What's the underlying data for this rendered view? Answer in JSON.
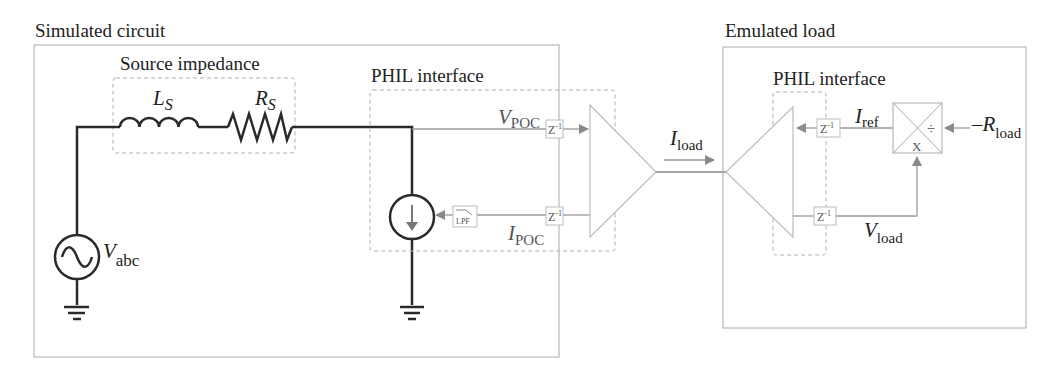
{
  "simulated_circuit": {
    "title": "Simulated circuit",
    "source_impedance": {
      "title": "Source impedance",
      "inductor": {
        "symbol": "L",
        "subscript": "S"
      },
      "resistor": {
        "symbol": "R",
        "subscript": "S"
      }
    },
    "voltage_source": {
      "symbol": "V",
      "subscript": "abc",
      "icon": "ac-source-icon"
    },
    "phil_interface": {
      "title": "PHIL interface",
      "v_signal": {
        "symbol": "V",
        "subscript": "POC"
      },
      "i_signal": {
        "symbol": "I",
        "subscript": "POC"
      },
      "delay_upper": {
        "label": "Z",
        "exponent": "-1"
      },
      "delay_lower": {
        "label": "Z",
        "exponent": "-1"
      },
      "filter": {
        "label": "LPF"
      },
      "current_source_icon": "controlled-current-source-icon"
    }
  },
  "link": {
    "current": {
      "symbol": "I",
      "subscript": "load"
    }
  },
  "emulated_load": {
    "title": "Emulated load",
    "phil_interface": {
      "title": "PHIL interface",
      "delay_upper": {
        "label": "Z",
        "exponent": "-1"
      },
      "delay_lower": {
        "label": "Z",
        "exponent": "-1"
      }
    },
    "i_ref": {
      "symbol": "I",
      "subscript": "ref"
    },
    "v_load": {
      "symbol": "V",
      "subscript": "load"
    },
    "r_load": {
      "symbol": "–R",
      "subscript": "load"
    },
    "mul_div_block": {
      "multiply": "X",
      "divide": "÷"
    }
  },
  "colors": {
    "wire": "#2a2a2a",
    "signal": "#9a9a9a",
    "arrow": "#8a8a8a",
    "box_border": "#aaaaaa",
    "dashed": "#b0b0b0",
    "triangle": "#bdbdbd"
  }
}
